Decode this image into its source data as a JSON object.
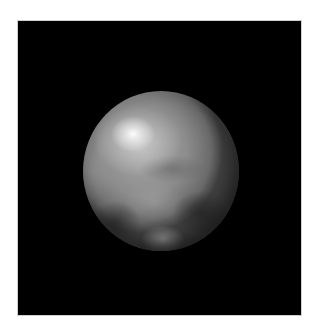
{
  "image": {
    "subject": "planet-sphere",
    "description": "Grayscale image of a spherical planetary body against a black square background",
    "background_color": "#000000",
    "page_color": "#ffffff",
    "planet": {
      "base_color": "#8c8c8c",
      "highlight_color": "#f5f5f5",
      "dark_region_color": "#2e2e2e",
      "features": [
        {
          "name": "bright-spot-upper-left",
          "tone": "bright"
        },
        {
          "name": "dark-patch-lower-right",
          "tone": "dark"
        },
        {
          "name": "dark-patch-lower-left",
          "tone": "dark"
        },
        {
          "name": "light-patch-bottom-center",
          "tone": "light"
        },
        {
          "name": "dark-band-middle",
          "tone": "medium-dark"
        }
      ]
    }
  }
}
